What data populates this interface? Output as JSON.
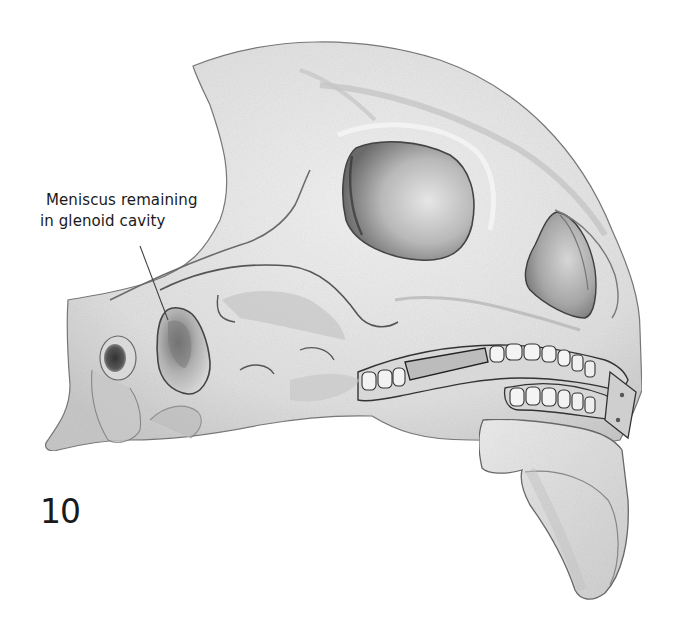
{
  "figure": {
    "number": "10",
    "annotation": {
      "line1": "Meniscus remaining",
      "line2": "in glenoid cavity"
    },
    "colors": {
      "background": "#ffffff",
      "bone_light": "#eeeeee",
      "bone_mid": "#d4d4d4",
      "bone_shadow": "#9a9a9a",
      "outline": "#555555",
      "cavity_dark": "#555555",
      "text": "#1a1a1a"
    },
    "structures": [
      "cranial-vault",
      "orbit",
      "nasal-aperture",
      "zygomatic-arch",
      "glenoid-cavity-with-meniscus",
      "external-auditory-meatus",
      "mastoid-process",
      "maxillary-teeth-with-splint",
      "mandibular-stump"
    ]
  }
}
